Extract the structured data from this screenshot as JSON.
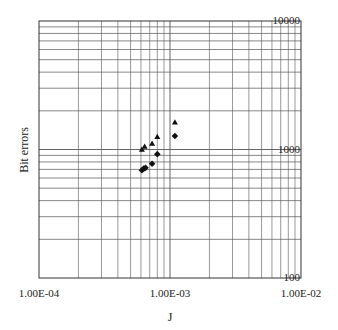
{
  "chart_data": {
    "type": "scatter",
    "title": "",
    "xlabel": "J",
    "ylabel": "Bit errors",
    "xscale": "log",
    "yscale": "log",
    "xlim": [
      0.0001,
      0.01
    ],
    "ylim": [
      100,
      10000
    ],
    "x_tick_labels": [
      "1.00E-04",
      "1.00E-03",
      "1.00E-02"
    ],
    "x_tick_values": [
      0.0001,
      0.001,
      0.01
    ],
    "y_tick_labels": [
      "100",
      "1000",
      "10000"
    ],
    "y_tick_values": [
      100,
      1000,
      10000
    ],
    "grid": true,
    "legend": null,
    "series": [
      {
        "name": "triangles",
        "marker": "triangle",
        "color": "#111111",
        "x": [
          0.00061,
          0.00064,
          0.00073,
          0.0008,
          0.00109
        ],
        "y": [
          995,
          1050,
          1110,
          1250,
          1620
        ]
      },
      {
        "name": "diamonds",
        "marker": "diamond",
        "color": "#111111",
        "x": [
          0.00061,
          0.00063,
          0.00065,
          0.00073,
          0.0008,
          0.00109
        ],
        "y": [
          690,
          710,
          720,
          775,
          920,
          1275
        ]
      }
    ]
  },
  "colors": {
    "grid": "#555555",
    "axis": "#333333",
    "marker": "#111111",
    "background": "#ffffff"
  }
}
